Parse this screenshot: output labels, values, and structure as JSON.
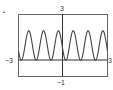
{
  "chart_data": {
    "type": "line",
    "title": "",
    "xlabel": "",
    "ylabel": "",
    "xlim": [
      -3,
      3
    ],
    "ylim": [
      -1,
      3
    ],
    "grid": false,
    "legend": null,
    "tick_labels": {
      "x_min": "−3",
      "x_max": "3",
      "y_max": "3",
      "y_min": "−1"
    },
    "series": [
      {
        "name": "f(x)",
        "description": "periodic wave oscillating between 0 and about 2, period about 1, six peaks visible",
        "x": [
          -3,
          -2.75,
          -2.5,
          -2.25,
          -2,
          -1.75,
          -1.5,
          -1.25,
          -1,
          -0.75,
          -0.5,
          -0.25,
          0,
          0.25,
          0.5,
          0.75,
          1,
          1.25,
          1.5,
          1.75,
          2,
          2.25,
          2.5,
          2.75,
          3
        ],
        "y": [
          0.68,
          1.93,
          1.32,
          0.07,
          0.68,
          1.93,
          1.32,
          0.07,
          0.68,
          1.93,
          1.32,
          0.07,
          0.68,
          1.93,
          1.32,
          0.07,
          0.68,
          1.93,
          1.32,
          0.07,
          0.68,
          1.93,
          1.32,
          0.07,
          0.68
        ]
      }
    ]
  },
  "labels": {
    "bullet": "•",
    "x_min": "−3",
    "x_max": "3",
    "y_max": "3",
    "y_min": "−1"
  },
  "colors": {
    "frame": "#555555",
    "axis": "#333333",
    "curve": "#444444"
  }
}
